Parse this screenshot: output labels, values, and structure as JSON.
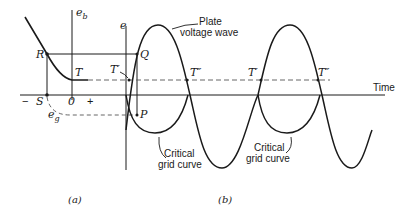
{
  "figure": {
    "panel_a": {
      "caption": "(a)",
      "axis_eb_label": "e",
      "axis_eb_sub": "b",
      "eg_label": "e",
      "eg_sub": "g",
      "point_R": "R",
      "point_T": "T",
      "point_S": "S",
      "origin": "0",
      "minus": "−",
      "plus": "+"
    },
    "panel_b": {
      "caption": "(b)",
      "axis_e_label": "e",
      "point_Q": "Q",
      "point_P": "P",
      "t_prime_1": "T′",
      "t_dblprime_1": "T″",
      "t_prime_2": "T′",
      "t_dblprime_2": "T″",
      "time_label": "Time",
      "plate_wave_line1": "Plate",
      "plate_wave_line2": "voltage wave",
      "critical_1_line1": "Critical",
      "critical_1_line2": "grid curve",
      "critical_2_line1": "Critical",
      "critical_2_line2": "grid curve"
    },
    "colors": {
      "ink": "#1a1a1a",
      "dash": "#555555",
      "background": "#ffffff"
    }
  }
}
